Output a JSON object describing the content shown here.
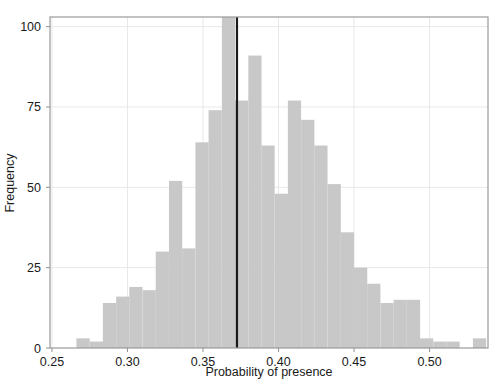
{
  "chart_data": {
    "type": "bar",
    "title": "",
    "subtitle": "",
    "xlabel": "Probability of presence",
    "ylabel": "Frequency",
    "xlim": [
      0.2487,
      0.5387
    ],
    "ylim": [
      0,
      103
    ],
    "xticks": [
      0.25,
      0.3,
      0.35,
      0.4,
      0.45,
      0.5
    ],
    "xtick_labels": [
      "0.25",
      "0.30",
      "0.35",
      "0.40",
      "0.45",
      "0.50"
    ],
    "yticks": [
      0,
      25,
      50,
      75,
      100
    ],
    "ytick_labels": [
      "0",
      "25",
      "50",
      "75",
      "100"
    ],
    "grid": true,
    "legend": "none",
    "bar_color": "#c8c8c8",
    "bin_width": 0.00875,
    "bin_left_edges": [
      0.2487,
      0.2575,
      0.2662,
      0.275,
      0.2837,
      0.2925,
      0.3012,
      0.31,
      0.3187,
      0.3275,
      0.3362,
      0.345,
      0.3537,
      0.3625,
      0.3712,
      0.38,
      0.3887,
      0.3975,
      0.4062,
      0.415,
      0.4237,
      0.4325,
      0.4412,
      0.45,
      0.4587,
      0.4675,
      0.4762,
      0.485,
      0.4937,
      0.5025,
      0.5112,
      0.52,
      0.5287
    ],
    "values": [
      0,
      0,
      3,
      2,
      14,
      16,
      19,
      18,
      30,
      52,
      31,
      64,
      74,
      106,
      77,
      91,
      63,
      48,
      77,
      71,
      63,
      51,
      36,
      25,
      20,
      14,
      15,
      15,
      3,
      2,
      2,
      0,
      3
    ],
    "annotations": [
      {
        "name": "threshold-line",
        "type": "vline",
        "x": 0.3725,
        "color": "#1a1a1a",
        "width_px": 2.2
      }
    ]
  },
  "axes": {
    "frame_color": "#9a9a9a",
    "grid_color": "#e8e8e8",
    "tick_color": "#9a9a9a"
  }
}
